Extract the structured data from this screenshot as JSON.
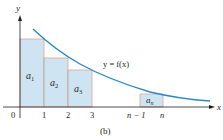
{
  "figure": {
    "caption": "(b)",
    "axes": {
      "x_label": "x",
      "y_label": "y",
      "origin_label": "0"
    },
    "curve_label": "y = f(x)",
    "x_ticks": [
      "1",
      "2",
      "3",
      "n − 1",
      "n"
    ],
    "rectangles": [
      {
        "label": "a",
        "sub": "1"
      },
      {
        "label": "a",
        "sub": "2"
      },
      {
        "label": "a",
        "sub": "3"
      },
      {
        "label": "a",
        "sub": "n"
      }
    ],
    "colors": {
      "curve": "#2b8ac6",
      "rect_fill": "#cfe4f3",
      "rect_stroke": "#e3a394",
      "axis": "#231f20"
    }
  }
}
